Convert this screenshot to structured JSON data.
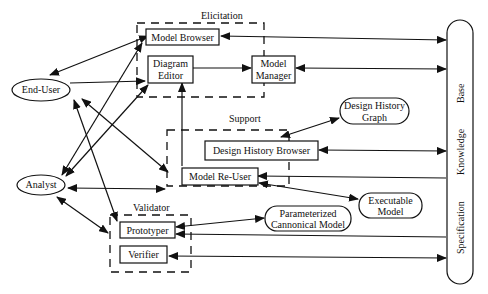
{
  "diagram": {
    "groups": {
      "elicitation": "Elicitation",
      "support": "Support",
      "validator": "Validator"
    },
    "actors": {
      "end_user": "End-User",
      "analyst": "Analyst"
    },
    "components": {
      "model_browser": "Model Browser",
      "diagram_editor_l1": "Diagram",
      "diagram_editor_l2": "Editor",
      "model_manager_l1": "Model",
      "model_manager_l2": "Manager",
      "design_history_browser": "Design History Browser",
      "model_reuser": "Model Re-User",
      "prototyper": "Prototyper",
      "verifier": "Verifier"
    },
    "artifacts": {
      "design_history_graph_l1": "Design History",
      "design_history_graph_l2": "Graph",
      "executable_model_l1": "Executable",
      "executable_model_l2": "Model",
      "param_model_l1": "Parameterized",
      "param_model_l2": "Cannonical Model"
    },
    "knowledge_base": {
      "w1": "Specification",
      "w2": "Knowledge",
      "w3": "Base"
    },
    "colors": {
      "stroke": "#111111",
      "background": "#ffffff"
    }
  }
}
